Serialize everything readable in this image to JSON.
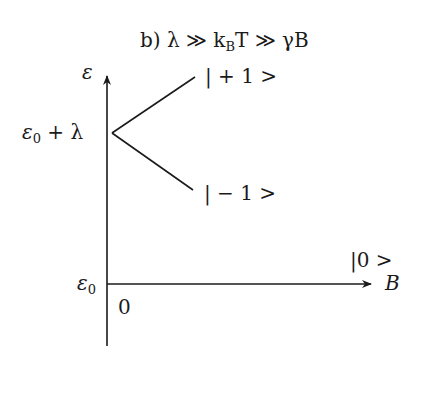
{
  "title_parts": {
    "prefix": "b) λ ≫ k",
    "sub": "B",
    "suffix": "T ≫ γB"
  },
  "y_axis": {
    "label": "ε"
  },
  "x_axis": {
    "label": "B"
  },
  "origin_label": "0",
  "levels": {
    "split_point": {
      "base": "ε",
      "sub": "0",
      "suffix": " + λ"
    },
    "ground": {
      "base": "ε",
      "sub": "0"
    }
  },
  "states": {
    "plus_one": "| + 1 >",
    "minus_one": "| − 1 >",
    "zero": "|0 >"
  },
  "colors": {
    "line": "#1a1a1a",
    "background": "#ffffff"
  }
}
